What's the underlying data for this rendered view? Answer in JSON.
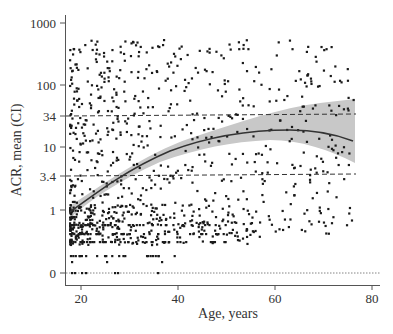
{
  "chart_data": {
    "type": "scatter",
    "title": "",
    "xlabel": "Age, years",
    "ylabel": "ACR, mean (CI)",
    "xlim": [
      17,
      81
    ],
    "y_scale": "log (with 0 category)",
    "x_ticks": [
      20,
      40,
      60,
      80
    ],
    "y_ticks": [
      "1000",
      "100",
      "34",
      "10",
      "3.4",
      "1",
      "0"
    ],
    "reference_lines": [
      {
        "y": 34,
        "style": "dashed"
      },
      {
        "y": 3.4,
        "style": "dashed"
      },
      {
        "y": 0,
        "style": "dotted"
      }
    ],
    "fit_curve": {
      "name": "mean ACR",
      "x": [
        18,
        25,
        30,
        35,
        40,
        45,
        50,
        55,
        60,
        65,
        70,
        76
      ],
      "y": [
        0.85,
        1.7,
        2.8,
        4.2,
        6.3,
        8.5,
        11.0,
        13.5,
        14.5,
        14.2,
        13.0,
        11.5
      ]
    },
    "ci_band": {
      "x": [
        18,
        30,
        40,
        50,
        60,
        70,
        76
      ],
      "lower": [
        0.7,
        2.4,
        5.5,
        9.0,
        10.5,
        7.5,
        5.0
      ],
      "upper": [
        1.05,
        3.3,
        7.2,
        13.5,
        19.0,
        24.0,
        27.0
      ]
    },
    "legend": "none",
    "grid": false,
    "colors": {
      "points": "#1a1a1a",
      "curve": "#333333",
      "band": "#c8c8c8",
      "axis": "#555555"
    }
  },
  "axes": {
    "x": {
      "title": "Age, years",
      "ticks": [
        {
          "label": "20",
          "px": 81
        },
        {
          "label": "40",
          "px": 178
        },
        {
          "label": "60",
          "px": 275
        },
        {
          "label": "80",
          "px": 372
        }
      ]
    },
    "y": {
      "title": "ACR, mean (CI)",
      "ticks": [
        {
          "label": "1000",
          "py": 23
        },
        {
          "label": "100",
          "py": 85
        },
        {
          "label": "34",
          "py": 116
        },
        {
          "label": "10",
          "py": 147
        },
        {
          "label": "3.4",
          "py": 176
        },
        {
          "label": "1",
          "py": 210
        },
        {
          "label": "0",
          "py": 273
        }
      ]
    }
  }
}
